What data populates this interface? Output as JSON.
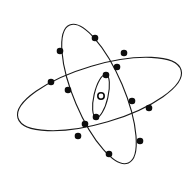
{
  "diagram": {
    "title": "Atom model",
    "colors": {
      "stroke": "#1a1a1a",
      "electron": "#0d0d0d",
      "nucleus_fill": "#ffffff",
      "background": "#ffffff"
    },
    "orbits": [
      {
        "name": "tall-orbit",
        "cx": 99,
        "cy": 94,
        "rx": 75,
        "ry": 25,
        "rotate": 67,
        "electrons": [
          [
            95,
            38
          ],
          [
            60,
            51
          ],
          [
            117,
            67
          ],
          [
            68,
            90
          ],
          [
            132,
            101
          ],
          [
            85,
            124
          ],
          [
            140,
            141
          ],
          [
            109,
            154
          ]
        ]
      },
      {
        "name": "wide-orbit",
        "cx": 99.5,
        "cy": 94,
        "rx": 85,
        "ry": 29,
        "rotate": -16.4,
        "electrons": [
          [
            124,
            53
          ],
          [
            51,
            82
          ],
          [
            149,
            108
          ],
          [
            78,
            136
          ]
        ]
      },
      {
        "name": "inner-orbit",
        "cx": 101,
        "cy": 96,
        "rx": 22,
        "ry": 7,
        "rotate": -77,
        "electrons": [
          [
            106,
            75
          ],
          [
            96,
            117
          ]
        ]
      }
    ],
    "nucleus": {
      "cx": 101,
      "cy": 96,
      "r": 3.2
    },
    "electron_radius": 3.3
  }
}
